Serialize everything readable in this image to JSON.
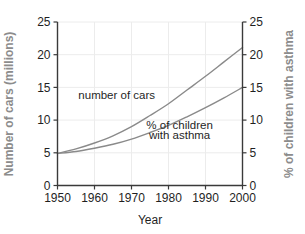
{
  "chart_data": {
    "type": "line",
    "title": "",
    "subtitle": "",
    "xlabel": "Year",
    "ylabel": "Number of cars (millions)",
    "y2label": "% of children with asthma",
    "xlim": [
      1950,
      2000
    ],
    "ylim": [
      0,
      25
    ],
    "y2lim": [
      0,
      25
    ],
    "grid": true,
    "legend_position": "inline-annotations",
    "xticks": [
      1950,
      1960,
      1970,
      1980,
      1990,
      2000
    ],
    "xticklabels": [
      "1950",
      "1960",
      "1970",
      "1980",
      "1990",
      "2000"
    ],
    "yticks": [
      0,
      5,
      10,
      15,
      20,
      25
    ],
    "yticklabels": [
      "0",
      "5",
      "10",
      "15",
      "20",
      "25"
    ],
    "y2ticks": [
      0,
      5,
      10,
      15,
      20,
      25
    ],
    "y2ticklabels": [
      "0",
      "5",
      "10",
      "15",
      "20",
      "25"
    ],
    "x": [
      1950,
      1955,
      1960,
      1965,
      1970,
      1975,
      1980,
      1985,
      1990,
      1995,
      2000
    ],
    "series": [
      {
        "name": "number of cars",
        "axis": "left",
        "units": "millions",
        "color": "#8a8a8a",
        "values": [
          4.9,
          5.6,
          6.5,
          7.6,
          9.0,
          10.7,
          12.5,
          14.6,
          16.7,
          18.9,
          21.1
        ]
      },
      {
        "name": "% of children with asthma",
        "axis": "right",
        "units": "percent",
        "color": "#8a8a8a",
        "values": [
          4.9,
          5.2,
          5.7,
          6.3,
          7.1,
          8.1,
          9.2,
          10.5,
          11.9,
          13.4,
          15.0
        ]
      }
    ],
    "annotations": [
      {
        "id": "cars",
        "text": "number of cars",
        "x": 1966,
        "y": 13.2
      },
      {
        "id": "asthma-line1",
        "text": "% of children",
        "x": 1983,
        "y": 8.6
      },
      {
        "id": "asthma-line2",
        "text": "with asthma",
        "x": 1983,
        "y": 7.1
      }
    ],
    "colors": {
      "series": "#8a8a8a",
      "axis": "#3a3a3a",
      "grid": "#ececec",
      "axis_title_side": "#8c8c8c",
      "tick_label": "#1f1f1f",
      "background": "#ffffff"
    }
  }
}
